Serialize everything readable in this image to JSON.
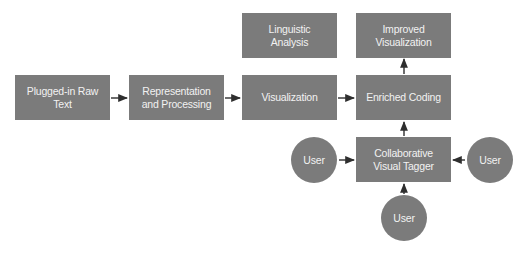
{
  "diagram": {
    "colors": {
      "node_fill": "#7b7b7b",
      "node_text": "#f2f2f2",
      "arrow": "#2e2e2e",
      "background": "#ffffff"
    },
    "nodes": {
      "raw_text": {
        "label": "Plugged-in Raw Text",
        "shape": "rect"
      },
      "representation": {
        "label": "Representation and Processing",
        "shape": "rect"
      },
      "visualization": {
        "label": "Visualization",
        "shape": "rect"
      },
      "enriched_coding": {
        "label": "Enriched Coding",
        "shape": "rect"
      },
      "linguistic_analysis": {
        "label": "Linguistic Analysis",
        "shape": "rect"
      },
      "improved_visualization": {
        "label": "Improved Visualization",
        "shape": "rect"
      },
      "visual_tagger": {
        "label": "Collaborative Visual Tagger",
        "shape": "rect"
      },
      "user_left": {
        "label": "User",
        "shape": "circle"
      },
      "user_right": {
        "label": "User",
        "shape": "circle"
      },
      "user_bottom": {
        "label": "User",
        "shape": "circle"
      }
    },
    "edges": [
      {
        "from": "raw_text",
        "to": "representation"
      },
      {
        "from": "representation",
        "to": "visualization"
      },
      {
        "from": "visualization",
        "to": "enriched_coding"
      },
      {
        "from": "enriched_coding",
        "to": "improved_visualization"
      },
      {
        "from": "visual_tagger",
        "to": "enriched_coding"
      },
      {
        "from": "user_left",
        "to": "visual_tagger"
      },
      {
        "from": "user_right",
        "to": "visual_tagger"
      },
      {
        "from": "user_bottom",
        "to": "visual_tagger"
      }
    ]
  }
}
